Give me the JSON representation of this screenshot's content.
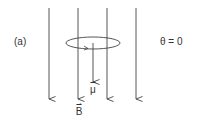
{
  "diagram": {
    "panel_label": "(a)",
    "angle_label": "θ = 0",
    "field_label": "B",
    "moment_label": "μ",
    "vector_arrow": "⇀",
    "colors": {
      "lines": "#444444",
      "text": "#333333",
      "background": "#ffffff"
    },
    "field_lines_x": [
      49,
      78,
      107,
      136
    ],
    "field_direction": "down",
    "moment_direction": "down",
    "loop": {
      "cx": 93,
      "cy": 43,
      "rx": 27,
      "ry": 6
    }
  }
}
